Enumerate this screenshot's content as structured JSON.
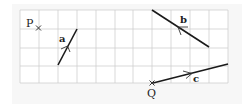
{
  "diagram": {
    "type": "vector-grid",
    "grid": {
      "columns": 11,
      "rows": 4,
      "origin_px": [
        20,
        10
      ],
      "cell_px": 19,
      "line_color": "#cfcfcf"
    },
    "points": [
      {
        "label": "P",
        "grid": [
          1,
          1
        ]
      },
      {
        "label": "Q",
        "grid": [
          7,
          4
        ]
      }
    ],
    "vectors": [
      {
        "label": "a",
        "from_grid": [
          2,
          3
        ],
        "to_grid": [
          3,
          1
        ],
        "arrow": "up-right"
      },
      {
        "label": "b",
        "from_grid": [
          10,
          2
        ],
        "to_grid": [
          7,
          0
        ],
        "arrow": "up-left"
      },
      {
        "label": "c",
        "from_grid": [
          7,
          4
        ],
        "to_grid": [
          11,
          3
        ],
        "arrow": "right"
      }
    ]
  },
  "labels": {
    "P": "P",
    "Q": "Q",
    "a": "a",
    "b": "b",
    "c": "c"
  },
  "colors": {
    "line": "#1a1a1a",
    "grid": "#cfcfcf",
    "panel": "#f7f7f7"
  }
}
